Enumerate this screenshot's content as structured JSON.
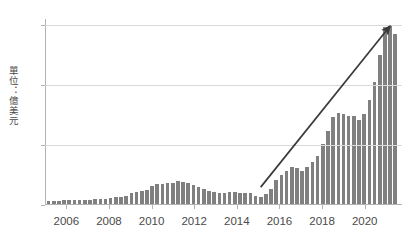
{
  "chart_data": {
    "type": "bar",
    "title": "",
    "xlabel": "",
    "ylabel": "單位：億美元",
    "ylim": [
      0,
      310
    ],
    "yticks": [
      0,
      100,
      200,
      300
    ],
    "ytick_labels": [
      "0",
      "100",
      "200",
      "300"
    ],
    "xtick_labels": [
      "2006",
      "2008",
      "2010",
      "2012",
      "2014",
      "2016",
      "2018",
      "2020"
    ],
    "xticks": [
      2006,
      2008,
      2010,
      2012,
      2014,
      2016,
      2018,
      2020
    ],
    "grid": true,
    "legend": "none",
    "frequency": "quarterly",
    "bar_color": "#808080",
    "x_start": 2005.0,
    "x_end": 2021.75,
    "categories": [
      "2005Q1",
      "2005Q2",
      "2005Q3",
      "2005Q4",
      "2006Q1",
      "2006Q2",
      "2006Q3",
      "2006Q4",
      "2007Q1",
      "2007Q2",
      "2007Q3",
      "2007Q4",
      "2008Q1",
      "2008Q2",
      "2008Q3",
      "2008Q4",
      "2009Q1",
      "2009Q2",
      "2009Q3",
      "2009Q4",
      "2010Q1",
      "2010Q2",
      "2010Q3",
      "2010Q4",
      "2011Q1",
      "2011Q2",
      "2011Q3",
      "2011Q4",
      "2012Q1",
      "2012Q2",
      "2012Q3",
      "2012Q4",
      "2013Q1",
      "2013Q2",
      "2013Q3",
      "2013Q4",
      "2014Q1",
      "2014Q2",
      "2014Q3",
      "2014Q4",
      "2015Q1",
      "2015Q2",
      "2015Q3",
      "2015Q4",
      "2016Q1",
      "2016Q2",
      "2016Q3",
      "2016Q4",
      "2017Q1",
      "2017Q2",
      "2017Q3",
      "2017Q4",
      "2018Q1",
      "2018Q2",
      "2018Q3",
      "2018Q4",
      "2019Q1",
      "2019Q2",
      "2019Q3",
      "2019Q4",
      "2020Q1",
      "2020Q2",
      "2020Q3",
      "2020Q4",
      "2021Q1",
      "2021Q2",
      "2021Q3",
      "2021Q4"
    ],
    "values": [
      5,
      5,
      5,
      6,
      6,
      6,
      6,
      7,
      7,
      8,
      8,
      9,
      10,
      11,
      12,
      13,
      18,
      20,
      22,
      23,
      30,
      33,
      34,
      35,
      36,
      38,
      37,
      36,
      32,
      28,
      25,
      22,
      20,
      19,
      19,
      20,
      20,
      19,
      18,
      18,
      13,
      12,
      16,
      25,
      40,
      48,
      55,
      62,
      60,
      55,
      62,
      70,
      80,
      100,
      123,
      145,
      152,
      150,
      148,
      148,
      140,
      150,
      175,
      205,
      250,
      297,
      300,
      285
    ],
    "annotation": {
      "type": "arrow",
      "label": "",
      "color": "#3a3a3a",
      "from": {
        "x": "2015Q2",
        "y": 30
      },
      "to": {
        "x": "2021Q3",
        "y": 300
      }
    }
  }
}
